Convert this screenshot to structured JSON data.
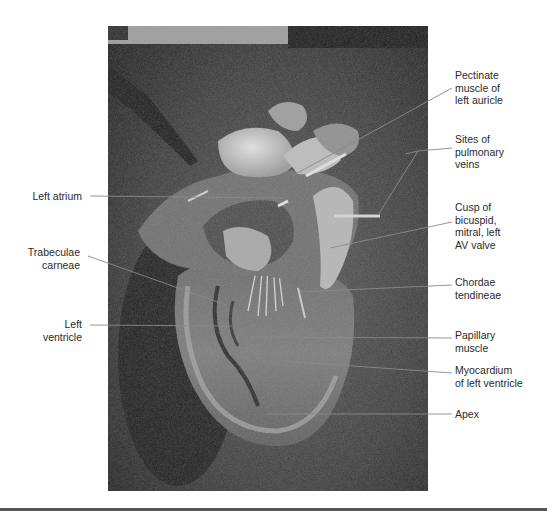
{
  "figure": {
    "labels_left": [
      {
        "id": "left-atrium",
        "text": "Left atrium"
      },
      {
        "id": "trabeculae-carneae",
        "text": "Trabeculae\ncarneae"
      },
      {
        "id": "left-ventricle",
        "text": "Left\nventricle"
      }
    ],
    "labels_right": [
      {
        "id": "pectinate-muscle",
        "text": "Pectinate\nmuscle of\nleft auricle"
      },
      {
        "id": "pulmonary-veins",
        "text": "Sites of\npulmonary\nveins"
      },
      {
        "id": "bicuspid-cusp",
        "text": "Cusp of\nbicuspid,\nmitral, left\nAV valve"
      },
      {
        "id": "chordae-tendineae",
        "text": "Chordae\ntendineae"
      },
      {
        "id": "papillary-muscle",
        "text": "Papillary\nmuscle"
      },
      {
        "id": "myocardium",
        "text": "Myocardium\nof left ventricle"
      },
      {
        "id": "apex",
        "text": "Apex"
      }
    ]
  }
}
